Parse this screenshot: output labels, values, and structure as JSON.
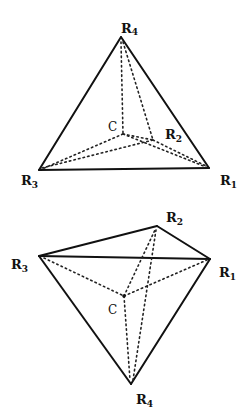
{
  "figures": [
    {
      "name": "tetrahedron-apex-up",
      "labels": {
        "R4": {
          "main": "R",
          "sub": "4"
        },
        "R3": {
          "main": "R",
          "sub": "3"
        },
        "R1": {
          "main": "R",
          "sub": "1"
        },
        "R2": {
          "main": "R",
          "sub": "2"
        },
        "C": "C"
      },
      "vertices": {
        "R4": [
          121,
          37
        ],
        "R3": [
          39,
          170
        ],
        "R1": [
          209,
          168
        ],
        "R2": [
          153,
          140
        ],
        "C": [
          123,
          134
        ]
      },
      "solid_edges": [
        [
          "R4",
          "R3"
        ],
        [
          "R4",
          "R1"
        ],
        [
          "R3",
          "R1"
        ]
      ],
      "hidden_edges": [
        [
          "R4",
          "R2"
        ],
        [
          "R3",
          "R2"
        ],
        [
          "R1",
          "R2"
        ],
        [
          "C",
          "R4"
        ],
        [
          "C",
          "R3"
        ],
        [
          "C",
          "R1"
        ],
        [
          "C",
          "R2"
        ]
      ]
    },
    {
      "name": "tetrahedron-apex-down",
      "labels": {
        "R2": {
          "main": "R",
          "sub": "2"
        },
        "R3": {
          "main": "R",
          "sub": "3"
        },
        "R1": {
          "main": "R",
          "sub": "1"
        },
        "R4": {
          "main": "R",
          "sub": "4"
        },
        "C": "C"
      },
      "vertices": {
        "R2": [
          157,
          226
        ],
        "R3": [
          39,
          256
        ],
        "R1": [
          210,
          259
        ],
        "R4": [
          131,
          384
        ],
        "C": [
          124,
          296
        ]
      },
      "solid_edges": [
        [
          "R3",
          "R2"
        ],
        [
          "R2",
          "R1"
        ],
        [
          "R3",
          "R1"
        ],
        [
          "R3",
          "R4"
        ],
        [
          "R1",
          "R4"
        ]
      ],
      "hidden_edges": [
        [
          "R2",
          "R4"
        ],
        [
          "C",
          "R3"
        ],
        [
          "C",
          "R1"
        ],
        [
          "C",
          "R2"
        ],
        [
          "C",
          "R4"
        ]
      ]
    }
  ]
}
